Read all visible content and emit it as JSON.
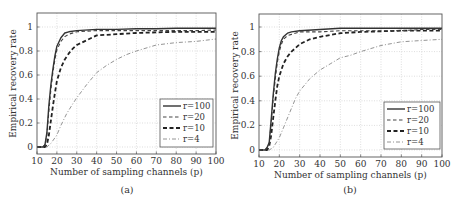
{
  "chart_data": [
    {
      "type": "line",
      "panel": "(a)",
      "caption": "(a)",
      "xlabel": "Number of sampling channels (p)",
      "ylabel": "Empirical recovery rate",
      "xlim": [
        10,
        100
      ],
      "ylim": [
        -0.05,
        1.1
      ],
      "xticks": [
        10,
        20,
        30,
        40,
        50,
        60,
        70,
        80,
        90,
        100
      ],
      "yticks": [
        0,
        0.2,
        0.4,
        0.6,
        0.8,
        1
      ],
      "ytick_labels": [
        "0",
        "0.2",
        "0.4",
        "0.6",
        "0.8",
        "1"
      ],
      "grid": true,
      "legend_position": "lower right",
      "series": [
        {
          "name": "r=100",
          "style": "solid",
          "x": [
            10,
            13,
            14,
            15,
            16,
            17,
            18,
            19,
            20,
            22,
            24,
            26,
            30,
            40,
            50,
            60,
            70,
            80,
            90,
            100
          ],
          "y": [
            0,
            0,
            0.02,
            0.12,
            0.35,
            0.52,
            0.65,
            0.76,
            0.84,
            0.91,
            0.95,
            0.96,
            0.97,
            0.98,
            0.98,
            0.985,
            0.985,
            0.99,
            0.99,
            0.99
          ]
        },
        {
          "name": "r=20",
          "style": "dashed",
          "x": [
            10,
            13,
            14,
            15,
            16,
            17,
            18,
            19,
            20,
            22,
            24,
            26,
            30,
            40,
            50,
            60,
            70,
            80,
            90,
            100
          ],
          "y": [
            0,
            0,
            0.02,
            0.1,
            0.3,
            0.48,
            0.62,
            0.73,
            0.81,
            0.88,
            0.92,
            0.94,
            0.96,
            0.97,
            0.97,
            0.97,
            0.97,
            0.97,
            0.97,
            0.975
          ]
        },
        {
          "name": "r=10",
          "style": "bold-dashed",
          "x": [
            10,
            14,
            15,
            16,
            17,
            18,
            19,
            20,
            22,
            24,
            26,
            28,
            30,
            35,
            40,
            50,
            60,
            70,
            80,
            90,
            100
          ],
          "y": [
            0,
            0,
            0.02,
            0.1,
            0.22,
            0.34,
            0.45,
            0.55,
            0.66,
            0.73,
            0.78,
            0.82,
            0.85,
            0.89,
            0.93,
            0.94,
            0.95,
            0.955,
            0.96,
            0.96,
            0.96
          ]
        },
        {
          "name": "r=4",
          "style": "dash-dot",
          "x": [
            10,
            15,
            17,
            20,
            22,
            25,
            28,
            30,
            35,
            40,
            45,
            50,
            55,
            60,
            70,
            80,
            90,
            100
          ],
          "y": [
            0,
            0,
            0.03,
            0.1,
            0.18,
            0.28,
            0.36,
            0.41,
            0.52,
            0.62,
            0.68,
            0.73,
            0.77,
            0.8,
            0.85,
            0.87,
            0.88,
            0.9
          ]
        }
      ]
    },
    {
      "type": "line",
      "panel": "(b)",
      "caption": "(b)",
      "xlabel": "Number of sampling channels (p)",
      "ylabel": "Empirical recovery rate",
      "xlim": [
        10,
        100
      ],
      "ylim": [
        -0.05,
        1.1
      ],
      "xticks": [
        10,
        20,
        30,
        40,
        50,
        60,
        70,
        80,
        90,
        100
      ],
      "yticks": [
        0,
        0.2,
        0.4,
        0.6,
        0.8,
        1
      ],
      "ytick_labels": [
        "0",
        "0.2",
        "0.4",
        "0.6",
        "0.8",
        "1"
      ],
      "grid": true,
      "legend_position": "lower right",
      "series": [
        {
          "name": "r=100",
          "style": "solid",
          "x": [
            10,
            13,
            14,
            15,
            16,
            17,
            18,
            19,
            20,
            21,
            22,
            24,
            26,
            30,
            40,
            50,
            60,
            70,
            80,
            90,
            100
          ],
          "y": [
            0,
            0,
            0.02,
            0.06,
            0.25,
            0.45,
            0.62,
            0.74,
            0.83,
            0.89,
            0.92,
            0.95,
            0.96,
            0.97,
            0.98,
            0.99,
            0.99,
            0.99,
            0.99,
            0.99,
            0.99
          ]
        },
        {
          "name": "r=20",
          "style": "dashed",
          "x": [
            10,
            13,
            14,
            15,
            16,
            17,
            18,
            19,
            20,
            21,
            22,
            24,
            26,
            30,
            40,
            50,
            60,
            70,
            80,
            90,
            100
          ],
          "y": [
            0,
            0,
            0.02,
            0.05,
            0.22,
            0.42,
            0.58,
            0.71,
            0.8,
            0.86,
            0.9,
            0.93,
            0.94,
            0.96,
            0.96,
            0.97,
            0.97,
            0.97,
            0.97,
            0.98,
            0.98
          ]
        },
        {
          "name": "r=10",
          "style": "bold-dashed",
          "x": [
            10,
            14,
            15,
            16,
            17,
            18,
            19,
            20,
            22,
            24,
            26,
            28,
            30,
            35,
            40,
            50,
            60,
            70,
            80,
            90,
            100
          ],
          "y": [
            0,
            0,
            0.03,
            0.12,
            0.26,
            0.4,
            0.52,
            0.6,
            0.7,
            0.76,
            0.8,
            0.83,
            0.86,
            0.9,
            0.92,
            0.95,
            0.96,
            0.965,
            0.97,
            0.97,
            0.97
          ]
        },
        {
          "name": "r=4",
          "style": "dash-dot",
          "x": [
            10,
            15,
            17,
            20,
            22,
            25,
            28,
            30,
            35,
            40,
            45,
            50,
            55,
            60,
            70,
            80,
            90,
            100
          ],
          "y": [
            0,
            0,
            0.02,
            0.1,
            0.18,
            0.3,
            0.42,
            0.48,
            0.58,
            0.65,
            0.7,
            0.75,
            0.77,
            0.8,
            0.85,
            0.88,
            0.89,
            0.9
          ]
        }
      ]
    }
  ]
}
